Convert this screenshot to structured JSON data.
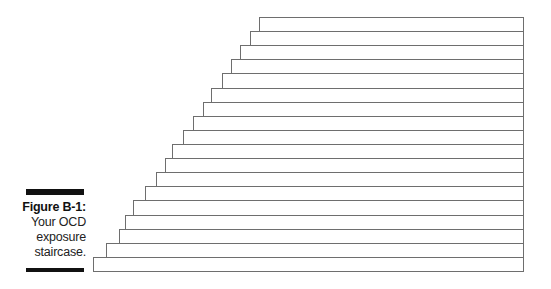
{
  "figure": {
    "label": "Figure B-1:",
    "caption_lines": [
      "Your OCD",
      "exposure",
      "staircase."
    ]
  },
  "staircase": {
    "step_count": 18,
    "right_edge": 523,
    "stroke_color": "#6e6e6e",
    "steps": [
      {
        "index": 18,
        "left": 259,
        "top": 17
      },
      {
        "index": 17,
        "left": 250,
        "top": 31
      },
      {
        "index": 16,
        "left": 240,
        "top": 45
      },
      {
        "index": 15,
        "left": 231,
        "top": 59
      },
      {
        "index": 14,
        "left": 222,
        "top": 73
      },
      {
        "index": 13,
        "left": 211,
        "top": 88
      },
      {
        "index": 12,
        "left": 203,
        "top": 102
      },
      {
        "index": 11,
        "left": 193,
        "top": 116
      },
      {
        "index": 10,
        "left": 183,
        "top": 130
      },
      {
        "index": 9,
        "left": 172,
        "top": 144
      },
      {
        "index": 8,
        "left": 165,
        "top": 158
      },
      {
        "index": 7,
        "left": 156,
        "top": 172
      },
      {
        "index": 6,
        "left": 145,
        "top": 186
      },
      {
        "index": 5,
        "left": 133,
        "top": 200
      },
      {
        "index": 4,
        "left": 125,
        "top": 215
      },
      {
        "index": 3,
        "left": 119,
        "top": 229
      },
      {
        "index": 2,
        "left": 106,
        "top": 243
      },
      {
        "index": 1,
        "left": 93,
        "top": 257
      }
    ],
    "bottom": 271
  }
}
